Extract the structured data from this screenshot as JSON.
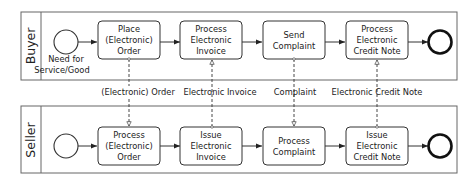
{
  "diagram": {
    "type": "bpmn-collaboration",
    "pools": [
      {
        "name": "Buyer",
        "start_event": {
          "label_lines": [
            "Need for",
            "Service/Good"
          ]
        },
        "tasks": [
          {
            "lines": [
              "Place",
              "(Electronic)",
              "Order"
            ]
          },
          {
            "lines": [
              "Process",
              "Electronic",
              "Invoice"
            ]
          },
          {
            "lines": [
              "Send",
              "Complaint"
            ]
          },
          {
            "lines": [
              "Process",
              "Electronic",
              "Credit Note"
            ]
          }
        ],
        "end_event": {
          "label_lines": []
        }
      },
      {
        "name": "Seller",
        "start_event": {
          "label_lines": []
        },
        "tasks": [
          {
            "lines": [
              "Process",
              "(Electronic)",
              "Order"
            ]
          },
          {
            "lines": [
              "Issue",
              "Electronic",
              "Invoice"
            ]
          },
          {
            "lines": [
              "Process",
              "Complaint"
            ]
          },
          {
            "lines": [
              "Issue",
              "Electronic",
              "Credit Note"
            ]
          }
        ],
        "end_event": {
          "label_lines": []
        }
      }
    ],
    "message_flows": [
      {
        "label": "(Electronic) Order",
        "from": "Buyer",
        "to": "Seller"
      },
      {
        "label": "Electronic Invoice",
        "from": "Seller",
        "to": "Buyer"
      },
      {
        "label": "Complaint",
        "from": "Buyer",
        "to": "Seller"
      },
      {
        "label": "Electronic Credit Note",
        "from": "Seller",
        "to": "Buyer"
      }
    ],
    "colors": {
      "stroke": "#333333",
      "pool_border": "#555555",
      "background": "#ffffff"
    }
  }
}
